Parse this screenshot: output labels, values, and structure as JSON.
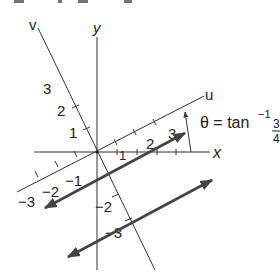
{
  "header_fragment": "w = . . . y  g  . . . . g",
  "axes": {
    "x_label": "x",
    "y_label": "y",
    "u_label": "u",
    "v_label": "v"
  },
  "u_ticks": [
    "-3",
    "-2",
    "-1",
    "1",
    "2",
    "3"
  ],
  "u_tick_labels": {
    "neg3": "−3",
    "neg2": "−2",
    "neg1": "−1",
    "pos1": "1",
    "pos2": "2",
    "pos3": "3"
  },
  "v_tick_labels": {
    "pos1": "1",
    "pos2": "2",
    "pos3": "3",
    "neg2": "−2",
    "neg3": "−3"
  },
  "angle_annotation": {
    "lhs": "θ = tan",
    "exponent": "−1",
    "numerator": "3",
    "denominator": "4"
  },
  "lines": [
    {
      "name": "line-u-equals-const-upper",
      "description": "thick double-headed line parallel to u-axis through v = -1"
    },
    {
      "name": "line-u-equals-const-lower",
      "description": "thick double-headed line parallel to u-axis through v = -3"
    }
  ]
}
